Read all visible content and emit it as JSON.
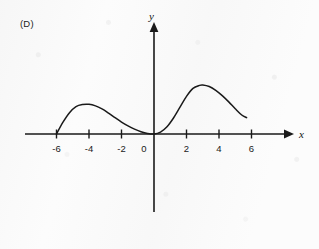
{
  "figure": {
    "panel_label": "(D)",
    "axis_x_label": "x",
    "axis_y_label": "y",
    "stroke_color": "#1a1a1a",
    "background_color": "#fcfcfc"
  },
  "chart_data": {
    "type": "line",
    "title": "",
    "subtitle": "",
    "xlabel": "x",
    "ylabel": "y",
    "legend": [],
    "grid": false,
    "xlim": [
      -7.5,
      7.0
    ],
    "ylim": [
      -4.2,
      4.2
    ],
    "xticks": [
      -6,
      -4,
      -2,
      0,
      2,
      4,
      6
    ],
    "xtick_labels": [
      "-6",
      "-4",
      "-2",
      "0",
      "2",
      "4",
      "6"
    ],
    "yticks": [],
    "ytick_labels": [],
    "annotations": [
      "curve meets x-axis at x = -6",
      "local maximum near x = -4",
      "curve is tangent to the x-axis at the origin (x = 0)",
      "local maximum near x = 3",
      "curve ends above the axis near x = 5.7"
    ],
    "series": [
      {
        "name": "curve",
        "x": [
          -6.0,
          -5.6,
          -5.2,
          -4.8,
          -4.4,
          -4.0,
          -3.6,
          -3.2,
          -2.8,
          -2.4,
          -2.0,
          -1.6,
          -1.2,
          -0.8,
          -0.4,
          0.0,
          0.4,
          0.8,
          1.2,
          1.6,
          2.0,
          2.4,
          2.8,
          3.0,
          3.4,
          3.8,
          4.2,
          4.6,
          5.0,
          5.4,
          5.7
        ],
        "y": [
          0.0,
          0.62,
          1.12,
          1.44,
          1.55,
          1.56,
          1.48,
          1.32,
          1.1,
          0.86,
          0.63,
          0.43,
          0.26,
          0.12,
          0.03,
          0.0,
          0.1,
          0.38,
          0.84,
          1.41,
          1.98,
          2.4,
          2.56,
          2.58,
          2.5,
          2.3,
          2.02,
          1.69,
          1.33,
          1.0,
          0.86
        ]
      }
    ]
  }
}
